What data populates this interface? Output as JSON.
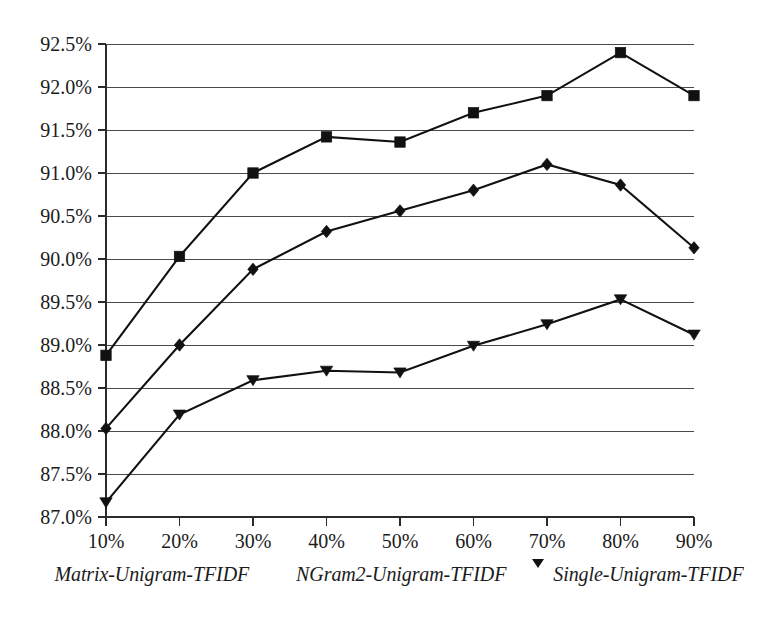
{
  "chart_data": {
    "type": "line",
    "title": "",
    "xlabel": "",
    "ylabel": "",
    "categories": [
      "10%",
      "20%",
      "30%",
      "40%",
      "50%",
      "60%",
      "70%",
      "80%",
      "90%"
    ],
    "x": [
      10,
      20,
      30,
      40,
      50,
      60,
      70,
      80,
      90
    ],
    "xlim": [
      10,
      90
    ],
    "ylim": [
      87.0,
      92.5
    ],
    "grid": true,
    "grid_axis": "y",
    "legend_position": "bottom",
    "ytick_labels": [
      "92.5%",
      "92.0%",
      "91.5%",
      "91.0%",
      "90.5%",
      "90.0%",
      "89.5%",
      "89.0%",
      "88.5%",
      "88.0%",
      "87.5%",
      "87.0%"
    ],
    "ytick_values": [
      92.5,
      92.0,
      91.5,
      91.0,
      90.5,
      90.0,
      89.5,
      89.0,
      88.5,
      88.0,
      87.5,
      87.0
    ],
    "xtick_labels": [
      "10%",
      "20%",
      "30%",
      "40%",
      "50%",
      "60%",
      "70%",
      "80%",
      "90%"
    ],
    "series": [
      {
        "name": "Matrix-Unigram-TFIDF",
        "marker": "square",
        "color": "#111111",
        "values": [
          88.88,
          90.03,
          91.0,
          91.42,
          91.36,
          91.7,
          91.9,
          92.4,
          91.9
        ]
      },
      {
        "name": "NGram2-Unigram-TFIDF",
        "marker": "diamond",
        "color": "#111111",
        "values": [
          88.03,
          89.0,
          89.88,
          90.32,
          90.56,
          90.8,
          91.1,
          90.86,
          90.13
        ]
      },
      {
        "name": "Single-Unigram-TFIDF",
        "marker": "triangle-down",
        "color": "#111111",
        "values": [
          87.17,
          88.19,
          88.59,
          88.7,
          88.68,
          88.99,
          89.24,
          89.53,
          89.12
        ]
      }
    ]
  },
  "legend": {
    "entries": [
      {
        "label": "Matrix-Unigram-TFIDF",
        "marker": "square"
      },
      {
        "label": "NGram2-Unigram-TFIDF",
        "marker": "diamond"
      },
      {
        "label": "Single-Unigram-TFIDF",
        "marker": "triangle-down"
      }
    ]
  }
}
